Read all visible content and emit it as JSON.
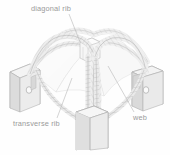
{
  "figure": {
    "kind": "isometric-line-diagram",
    "background_color": "#fefefe",
    "label_color": "#9a9a9a",
    "stroke_color": "#b9b9b9",
    "pier_fill_light": "#f2f2f2",
    "pier_fill_mid": "#e3e3e3",
    "pier_fill_dark": "#d2d2d2",
    "rib_fill": "#ededed",
    "web_fill": "#f7f7f7"
  },
  "labels": {
    "diagonal_rib": "diagonal rib",
    "transverse_rib": "transverse rib",
    "web": "web"
  },
  "parts": {
    "left_pier": "left pier block",
    "right_pier": "right pier block",
    "center_pier": "center pier column",
    "boss": "vault boss"
  }
}
